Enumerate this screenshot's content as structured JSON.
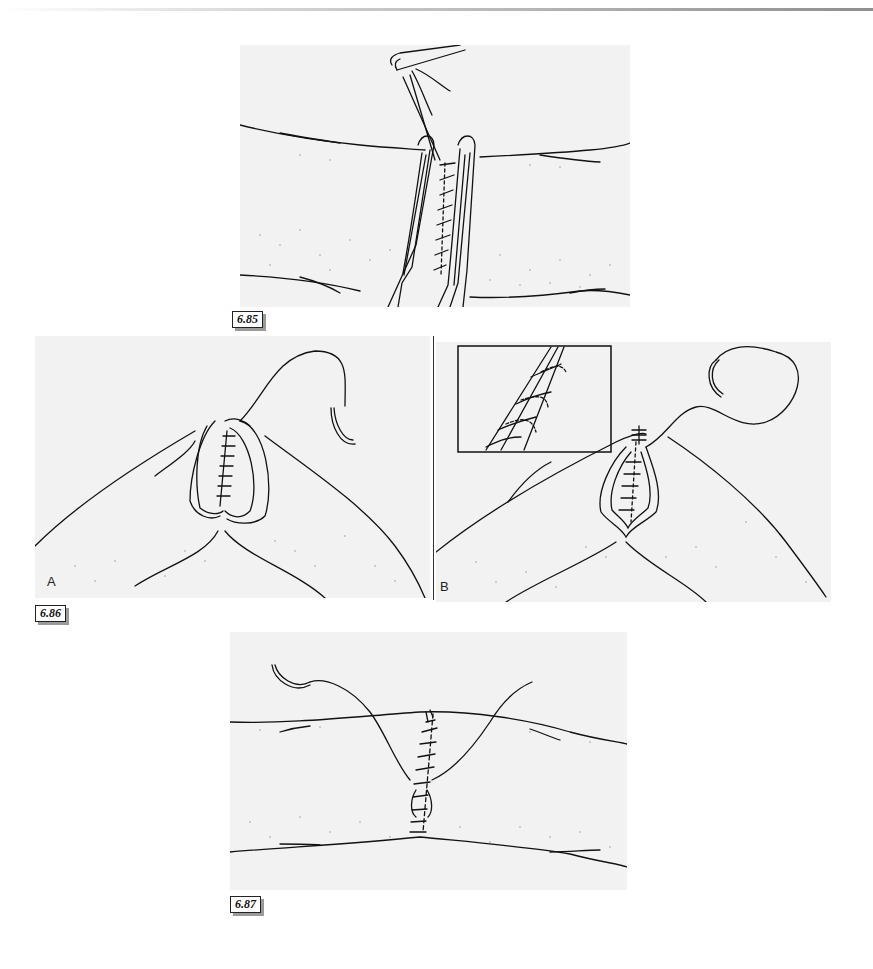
{
  "page": {
    "type": "book-page-illustrations",
    "background": "#ffffff",
    "panel_fill": "#f2f2f2",
    "line_color": "#111111"
  },
  "figures": [
    {
      "id": "fig-6-85",
      "label": "6.85",
      "description": "Forceps everting wound edges while a continuous suture is placed along the incision; needle holder at top"
    },
    {
      "id": "fig-6-86",
      "label": "6.86",
      "panels": [
        {
          "letter": "A",
          "description": "Everted wound edges pinched together with sutures in place; curved needle with thread at upper right"
        },
        {
          "letter": "B",
          "description": "Continuation of suture with inset detail showing looped stitch technique; curved needle and thread at upper right"
        }
      ],
      "inset": {
        "description": "Close-up of suture loops passing through tissue edges (dashed lines show hidden thread)"
      }
    },
    {
      "id": "fig-6-87",
      "label": "6.87",
      "description": "Completed closure with interrupted stitches along incision; two thread ends with curved needle at upper left"
    }
  ]
}
